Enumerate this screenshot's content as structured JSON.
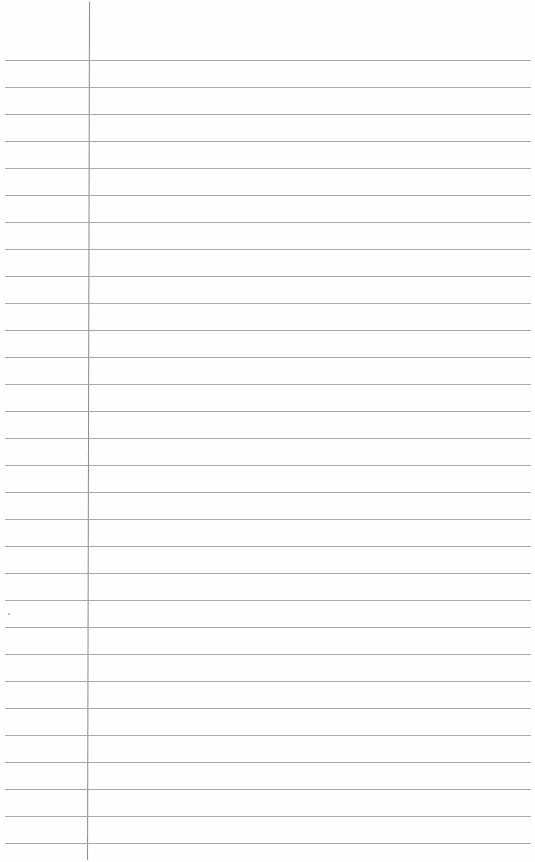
{
  "page": {
    "type": "lined-paper",
    "background_color": "#fefefe",
    "rule_color": "#9a9a9a",
    "margin_line_color": "#8a8a8a",
    "first_rule_y": 60,
    "rule_spacing": 27,
    "rule_count": 30,
    "margin_line_x": 89
  }
}
